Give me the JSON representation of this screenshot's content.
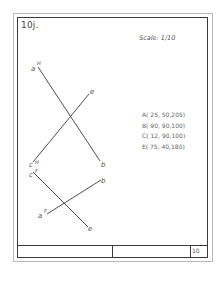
{
  "sheet": {
    "title": "10j.",
    "scale": "Scale: 1/10",
    "sheet_number": "10"
  },
  "points_table": [
    "A( 25, 50,205)",
    "B( 90, 90,100)",
    "C( 12, 90,100)",
    "E( 75, 40,180)"
  ],
  "drawing": {
    "horizontal_view": {
      "lines": [
        {
          "from": "a",
          "to": "b"
        },
        {
          "from": "e",
          "to": "c"
        }
      ],
      "labels": {
        "a": "a",
        "a_sup": "H",
        "b": "b",
        "e": "e",
        "c": "c",
        "c_sup": "H"
      }
    },
    "frontal_view": {
      "lines": [
        {
          "from": "c",
          "to": "e"
        },
        {
          "from": "a",
          "to": "b"
        }
      ],
      "labels": {
        "c": "c",
        "c_sup": "F",
        "e": "e",
        "a": "a",
        "a_sup": "F",
        "b": "b"
      }
    },
    "line_color": "#3a3a3a"
  }
}
